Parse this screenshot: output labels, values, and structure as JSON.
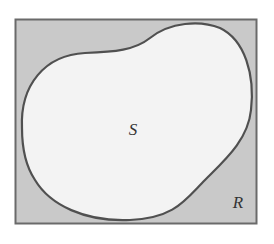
{
  "diagram": {
    "type": "venn-region",
    "colors": {
      "background": "#ffffff",
      "rect_fill": "#c9c9c9",
      "rect_border": "#6a6a6a",
      "blob_fill": "#f3f3f3",
      "blob_stroke": "#505050"
    },
    "rect": {
      "x": 15,
      "y": 19,
      "width": 242,
      "height": 205,
      "label": "R"
    },
    "blob": {
      "label": "S"
    },
    "labels": {
      "inner": "S",
      "outer": "R"
    }
  }
}
